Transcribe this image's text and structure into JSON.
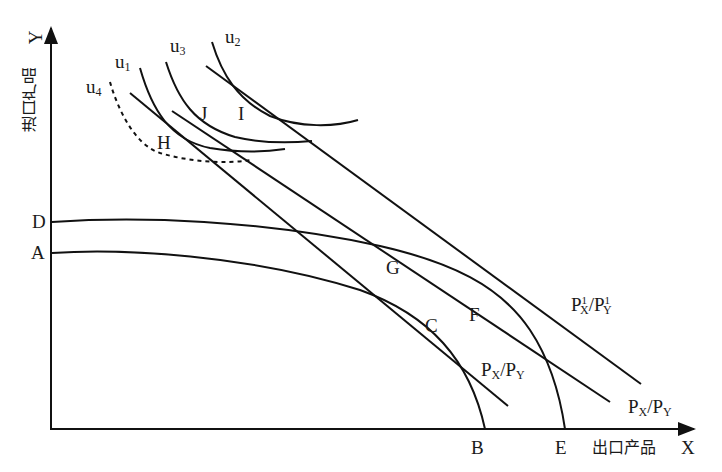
{
  "diagram": {
    "title": "",
    "axes": {
      "y_axis_label_cn": "进口产品",
      "y_axis_symbol": "Y",
      "x_axis_label_cn": "出口产品",
      "x_axis_symbol": "X"
    },
    "points": {
      "A": "A",
      "B": "B",
      "C": "C",
      "D": "D",
      "E": "E",
      "F": "F",
      "G": "G",
      "H": "H",
      "I": "I",
      "J": "J"
    },
    "indifference_curves": {
      "u1": {
        "base": "u",
        "sub": "1"
      },
      "u2": {
        "base": "u",
        "sub": "2"
      },
      "u3": {
        "base": "u",
        "sub": "3"
      },
      "u4": {
        "base": "u",
        "sub": "4",
        "style": "dashed"
      }
    },
    "price_lines": {
      "line_c": {
        "p": "P",
        "x_sub": "X",
        "slash": "/",
        "y_sub": "Y",
        "label": "Px/Py"
      },
      "line_f": {
        "p": "P",
        "x_sub": "X",
        "slash": "/",
        "y_sub": "Y",
        "label": "Px/Py"
      },
      "line_new": {
        "p": "P",
        "x_sub": "X",
        "y_sub": "Y",
        "sup": "1",
        "slash": "/",
        "label": "P1x/P1y"
      }
    },
    "curves": {
      "ppf_original": "A-C-B",
      "ppf_expanded": "D-G-F-E"
    },
    "colors": {
      "line": "#111111",
      "background": "#ffffff"
    }
  }
}
